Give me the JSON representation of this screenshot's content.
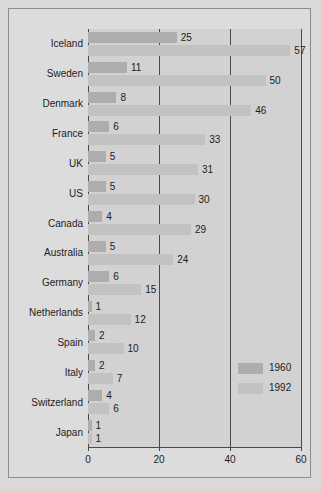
{
  "chart_data": {
    "type": "bar",
    "orientation": "horizontal",
    "title": "",
    "subtitle": "",
    "xlabel": "",
    "ylabel": "",
    "xlim": [
      0,
      60
    ],
    "xticks": [
      0,
      20,
      40,
      60
    ],
    "xticklabels": [
      "0",
      "20",
      "40",
      "60"
    ],
    "grid": true,
    "grid_axis": "x",
    "legend_position": "inside-right-lower",
    "categories": [
      "Iceland",
      "Sweden",
      "Denmark",
      "France",
      "UK",
      "US",
      "Canada",
      "Australia",
      "Germany",
      "Netherlands",
      "Spain",
      "Italy",
      "Switzerland",
      "Japan"
    ],
    "series": [
      {
        "name": "1960",
        "color": "#adadad",
        "values": [
          25,
          11,
          8,
          6,
          5,
          5,
          4,
          5,
          6,
          1,
          2,
          2,
          4,
          1
        ]
      },
      {
        "name": "1992",
        "color": "#c2c2c2",
        "values": [
          57,
          50,
          46,
          33,
          31,
          30,
          29,
          24,
          15,
          12,
          10,
          7,
          6,
          1
        ]
      }
    ],
    "data_labels": {
      "Iceland": {
        "1960": "25",
        "1992": "57"
      },
      "Sweden": {
        "1960": "11",
        "1992": "50"
      },
      "Denmark": {
        "1960": "8",
        "1992": "46"
      },
      "France": {
        "1960": "6",
        "1992": "33"
      },
      "UK": {
        "1960": "5",
        "1992": "31"
      },
      "US": {
        "1960": "5",
        "1992": "30"
      },
      "Canada": {
        "1960": "4",
        "1992": "29"
      },
      "Australia": {
        "1960": "5",
        "1992": "24"
      },
      "Germany": {
        "1960": "6",
        "1992": "15"
      },
      "Netherlands": {
        "1960": "1",
        "1992": "12"
      },
      "Spain": {
        "1960": "2",
        "1992": "10"
      },
      "Italy": {
        "1960": "2",
        "1992": "7"
      },
      "Switzerland": {
        "1960": "4",
        "1992": "6"
      },
      "Japan": {
        "1960": "1",
        "1992": "1"
      }
    }
  },
  "legend": {
    "entries": [
      {
        "label": "1960",
        "color": "#adadad"
      },
      {
        "label": "1992",
        "color": "#c2c2c2"
      }
    ]
  },
  "colors": {
    "series_1960": "#adadad",
    "series_1992": "#c2c2c2",
    "plot_background": "#d2d2d2",
    "figure_background": "#dcdcdc",
    "axis": "#4a4a4a",
    "text": "#1c1c1c"
  }
}
